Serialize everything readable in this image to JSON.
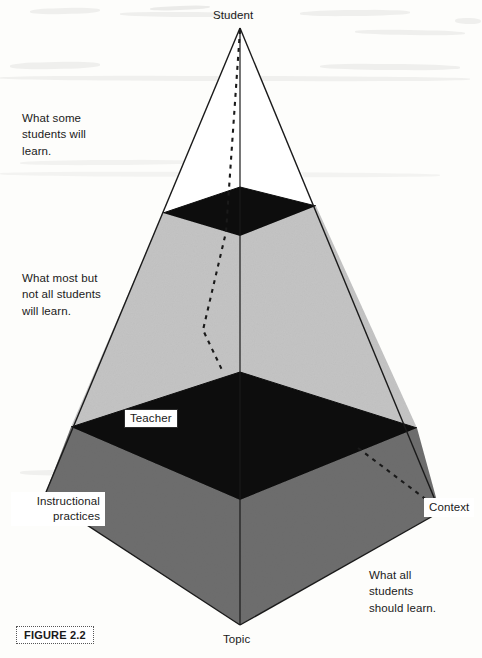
{
  "figure": {
    "tag": "FIGURE 2.2"
  },
  "vertices": {
    "apex": "Student",
    "front_base": "Topic",
    "left_base": "Instructional\npractices",
    "right_base": "Context",
    "mid_band": "Teacher"
  },
  "annotations": {
    "top": "What some\nstudents   will\nlearn.",
    "middle": "What most but\nnot all students\nwill learn.",
    "bottom": "What all\nstudents\nshould learn."
  },
  "colors": {
    "paper": "#fdfdfb",
    "ink": "#1a1a1a",
    "band_black": "#0d0d0d",
    "light_grey": "#c4c4c4",
    "dark_grey": "#6e6e6e",
    "label_box": "#ffffff"
  },
  "geometry": {
    "apex": [
      240,
      28
    ],
    "base_left": [
      44,
      497
    ],
    "base_right": [
      440,
      512
    ],
    "base_front": [
      240,
      625
    ],
    "base_back": [
      240,
      372
    ],
    "upper_band": {
      "back": [
        240,
        187
      ],
      "left": [
        163,
        213
      ],
      "right": [
        316,
        206
      ],
      "front": [
        240,
        236
      ]
    },
    "lower_band": {
      "back": [
        240,
        372
      ],
      "left": [
        71,
        427
      ],
      "right": [
        417,
        428
      ],
      "front": [
        240,
        500
      ]
    }
  }
}
